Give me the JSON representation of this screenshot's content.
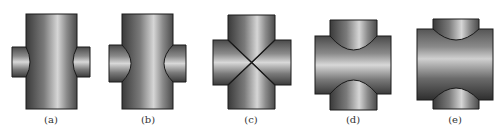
{
  "figure": {
    "panels": [
      {
        "id": "a",
        "label": "(a)",
        "caption_x": 51,
        "type": "vertical-main, small side branches"
      },
      {
        "id": "b",
        "label": "(b)",
        "caption_x": 148,
        "type": "vertical-main, larger side branches"
      },
      {
        "id": "c",
        "label": "(c)",
        "caption_x": 251,
        "type": "equal-diameter cross, diagonal seams"
      },
      {
        "id": "d",
        "label": "(d)",
        "caption_x": 353,
        "type": "horizontal-main, vertical branches (deep)"
      },
      {
        "id": "e",
        "label": "(e)",
        "caption_x": 455,
        "type": "horizontal-main, vertical branches (shallow)"
      }
    ]
  },
  "colors": {
    "background": "#ffffff",
    "outline": "#1a1a1a",
    "metal_dark": "#3a3a3a",
    "metal_mid": "#6e6e6e",
    "metal_light": "#d4d4d4",
    "caption": "#333333"
  }
}
